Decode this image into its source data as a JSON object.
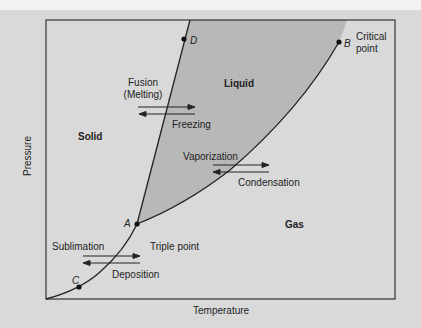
{
  "diagram": {
    "type": "phase-diagram",
    "axes": {
      "x_label": "Temperature",
      "y_label": "Pressure"
    },
    "regions": {
      "solid": "Solid",
      "liquid": "Liquid",
      "gas": "Gas"
    },
    "points": {
      "A": {
        "label": "A",
        "caption": "Triple point"
      },
      "B": {
        "label": "B",
        "caption_line1": "Critical",
        "caption_line2": "point"
      },
      "C": {
        "label": "C"
      },
      "D": {
        "label": "D"
      }
    },
    "transitions": {
      "fusion_line1": "Fusion",
      "fusion_line2": "(Melting)",
      "freezing": "Freezing",
      "vaporization": "Vaporization",
      "condensation": "Condensation",
      "sublimation": "Sublimation",
      "deposition": "Deposition"
    },
    "colors": {
      "background": "#d9d9d9",
      "liquid_fill": "#b8b8b8",
      "lines": "#222222"
    }
  }
}
